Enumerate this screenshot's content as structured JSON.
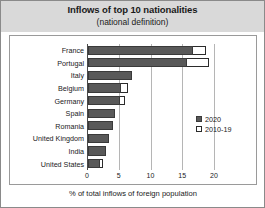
{
  "chart_data": {
    "type": "bar",
    "orientation": "horizontal",
    "title": "Inflows of top 10 nationalities",
    "subtitle": "(national definition)",
    "xlabel": "% of total inflows of foreign population",
    "ylabel": "",
    "xlim": [
      0,
      20
    ],
    "xticks": [
      0,
      5,
      10,
      15,
      20
    ],
    "xtick_labels": [
      "0",
      "5",
      "10",
      "15",
      "20"
    ],
    "grid": true,
    "legend_position": "right-middle",
    "categories": [
      "France",
      "Portugal",
      "Italy",
      "Belgium",
      "Germany",
      "Spain",
      "Romania",
      "United Kingdom",
      "India",
      "United States"
    ],
    "series": [
      {
        "name": "2020",
        "style": "filled",
        "color": "#595959",
        "values": [
          16.6,
          15.6,
          7.0,
          5.2,
          5.1,
          4.2,
          3.9,
          3.3,
          2.8,
          1.9
        ]
      },
      {
        "name": "2010-19",
        "style": "hollow",
        "color": "#ffffff",
        "values": [
          18.6,
          19.1,
          7.0,
          6.3,
          5.9,
          4.2,
          3.9,
          3.3,
          2.8,
          2.4
        ]
      }
    ]
  },
  "legend": {
    "items": [
      {
        "label": "2020"
      },
      {
        "label": "2010-19"
      }
    ]
  },
  "colors": {
    "title_band": "#d9d9d9",
    "bar_2020": "#595959",
    "bar_2010_19": "#ffffff",
    "gridline": "#b5b5b5",
    "frame": "#9a9a9a"
  }
}
